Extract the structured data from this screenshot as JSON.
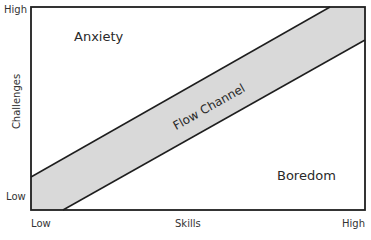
{
  "diagram": {
    "title": "Flow Channel",
    "y_axis": {
      "label": "Challenges",
      "high": "High",
      "low": "Low"
    },
    "x_axis": {
      "label": "Skills",
      "low": "Low",
      "high": "High"
    },
    "regions": {
      "anxiety": "Anxiety",
      "flow": "Flow Channel",
      "boredom": "Boredom"
    },
    "colors": {
      "band_fill": "#d9d9d9",
      "line": "#1e1e1e",
      "background": "#ffffff"
    },
    "partial_caption": "– – – – – – – – – –"
  }
}
